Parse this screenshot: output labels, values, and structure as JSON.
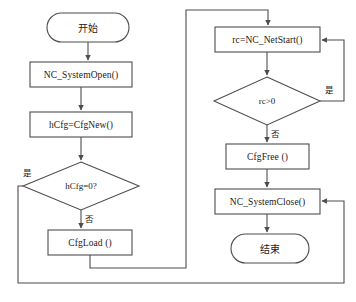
{
  "diagram": {
    "stroke_color": "#4d4d4d",
    "text_color": "#1a1a1a",
    "background_color": "#ffffff",
    "nodes": [
      {
        "id": "start",
        "type": "terminator",
        "label": "开始"
      },
      {
        "id": "system_open",
        "type": "process",
        "label": "NC_SystemOpen()"
      },
      {
        "id": "cfg_new",
        "type": "process",
        "label": "hCfg=CfgNew()"
      },
      {
        "id": "cfg_check",
        "type": "decision",
        "label": "hCfg=0?"
      },
      {
        "id": "cfg_load",
        "type": "process",
        "label": "CfgLoad ()"
      },
      {
        "id": "net_start",
        "type": "process",
        "label": "rc=NC_NetStart()"
      },
      {
        "id": "rc_check",
        "type": "decision",
        "label": "rc>0"
      },
      {
        "id": "cfg_free",
        "type": "process",
        "label": "CfgFree ()"
      },
      {
        "id": "system_close",
        "type": "process",
        "label": "NC_SystemClose()"
      },
      {
        "id": "end",
        "type": "terminator",
        "label": "结束"
      }
    ],
    "edge_labels": {
      "cfg_check_yes": "是",
      "cfg_check_no": "否",
      "rc_check_yes": "是",
      "rc_check_no": "否"
    }
  }
}
